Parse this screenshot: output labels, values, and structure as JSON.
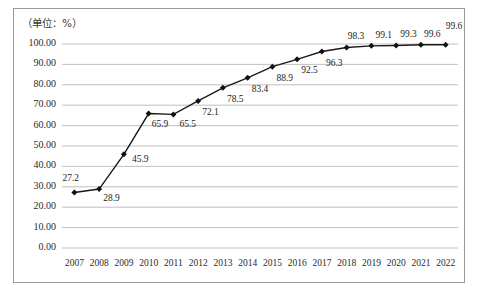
{
  "figure": {
    "unit_note": "（单位：%）",
    "border_color": "#9a9a9a",
    "background": "#ffffff"
  },
  "chart_data": {
    "type": "line",
    "title": "",
    "subtitle": "",
    "xlabel": "",
    "ylabel": "",
    "unit_note": "（单位：%）",
    "grid": true,
    "legend": "none",
    "marker": "diamond",
    "line_color": "#1a1a1a",
    "marker_color": "#111111",
    "grid_color": "#b9b9b9",
    "ylim": [
      0,
      100
    ],
    "ytick_step": 10,
    "ytick_labels": [
      "0.00",
      "10.00",
      "20.00",
      "30.00",
      "40.00",
      "50.00",
      "60.00",
      "70.00",
      "80.00",
      "90.00",
      "100.00"
    ],
    "ytick_values": [
      0,
      10,
      20,
      30,
      40,
      50,
      60,
      70,
      80,
      90,
      100
    ],
    "categories": [
      "2007",
      "2008",
      "2009",
      "2010",
      "2011",
      "2012",
      "2013",
      "2014",
      "2015",
      "2016",
      "2017",
      "2018",
      "2019",
      "2020",
      "2021",
      "2022"
    ],
    "values": [
      27.2,
      28.9,
      45.9,
      65.9,
      65.5,
      72.1,
      78.5,
      83.4,
      88.9,
      92.5,
      96.3,
      98.3,
      99.1,
      99.3,
      99.6,
      99.6
    ],
    "data_labels": [
      "27.2",
      "28.9",
      "45.9",
      "65.9",
      "65.5",
      "72.1",
      "78.5",
      "83.4",
      "88.9",
      "92.5",
      "96.3",
      "98.3",
      "99.1",
      "99.3",
      "99.6",
      "99.6"
    ],
    "label_offsets": [
      [
        -12,
        -14
      ],
      [
        4,
        10
      ],
      [
        8,
        6
      ],
      [
        3,
        11
      ],
      [
        6,
        11
      ],
      [
        4,
        12
      ],
      [
        4,
        12
      ],
      [
        4,
        12
      ],
      [
        4,
        12
      ],
      [
        4,
        12
      ],
      [
        4,
        12
      ],
      [
        1,
        -10
      ],
      [
        4,
        -10
      ],
      [
        4,
        -10
      ],
      [
        3,
        -10
      ],
      [
        0,
        -18
      ]
    ]
  }
}
